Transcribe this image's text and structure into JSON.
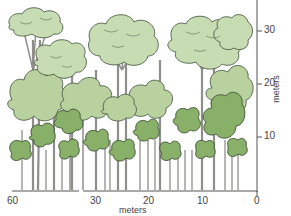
{
  "figure": {
    "type": "forest-profile-diagram",
    "colors": {
      "emergent_crown": "#c6d9b0",
      "canopy_crown": "#b4cf9a",
      "understory_crown": "#86ad64",
      "outline": "#4a5a44",
      "trunk": "#9a9a96",
      "axis": "#555555",
      "background": "#ffffff"
    }
  },
  "x_axis": {
    "title": "meters",
    "ticks": [
      "60",
      "30",
      "20",
      "10",
      "0"
    ],
    "broken_between": [
      "60",
      "30"
    ]
  },
  "y_axis": {
    "title": "meters",
    "ticks": [
      "30",
      "20",
      "10",
      "0"
    ]
  },
  "layers": [
    {
      "name": "emergent",
      "height_range_m": [
        25,
        35
      ]
    },
    {
      "name": "canopy",
      "height_range_m": [
        12,
        25
      ]
    },
    {
      "name": "understory",
      "height_range_m": [
        0,
        12
      ]
    }
  ]
}
